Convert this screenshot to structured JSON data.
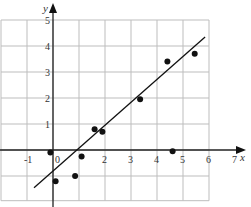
{
  "chart_data": {
    "type": "scatter",
    "title": "",
    "xlabel": "x",
    "ylabel": "y",
    "xlim": [
      -2,
      7
    ],
    "ylim": [
      -1.9,
      5.5
    ],
    "grid": true,
    "legend": null,
    "x_ticks": [
      "-1",
      "0",
      "2",
      "3",
      "4",
      "5",
      "6",
      "7"
    ],
    "y_ticks": [
      "1",
      "2",
      "3",
      "4",
      "5"
    ],
    "series": [
      {
        "name": "points",
        "points": [
          {
            "x": -0.1,
            "y": -0.1
          },
          {
            "x": 0.1,
            "y": -1.2
          },
          {
            "x": 0.85,
            "y": -1.0
          },
          {
            "x": 1.1,
            "y": -0.25
          },
          {
            "x": 1.6,
            "y": 0.8
          },
          {
            "x": 1.9,
            "y": 0.7
          },
          {
            "x": 3.35,
            "y": 1.95
          },
          {
            "x": 4.4,
            "y": 3.4
          },
          {
            "x": 4.6,
            "y": -0.05
          },
          {
            "x": 5.45,
            "y": 3.7
          }
        ]
      }
    ],
    "fit_line": {
      "x1": -0.73,
      "y1": -1.45,
      "x2": 5.85,
      "y2": 4.35
    }
  }
}
